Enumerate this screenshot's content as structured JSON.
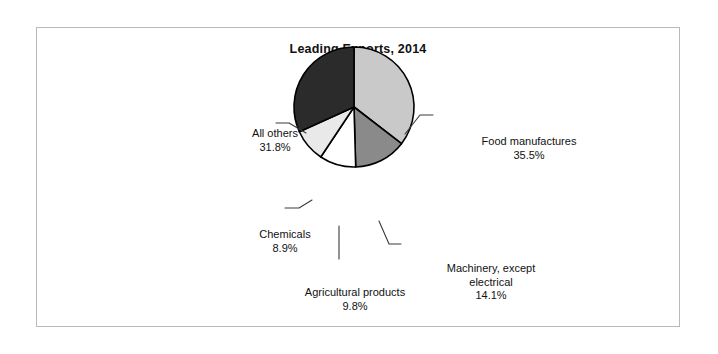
{
  "figure": {
    "title": "Leading Exports, 2014",
    "background": "#ffffff",
    "frame_color": "#b9b9b9"
  },
  "chart_data": {
    "type": "pie",
    "title": "Leading Exports, 2014",
    "xlabel": "",
    "ylabel": "",
    "legend_position": "none",
    "grid": false,
    "labels_outside": true,
    "start_angle_deg": 0,
    "direction": "clockwise",
    "categories": [
      "Food manufactures",
      "Machinery, except electrical",
      "Agricultural products",
      "Chemicals",
      "All others"
    ],
    "values": [
      35.5,
      14.1,
      9.8,
      8.9,
      31.8
    ],
    "value_suffix": "%",
    "colors": [
      "#c9c9c9",
      "#8a8a8a",
      "#ffffff",
      "#e9e9e9",
      "#2b2b2b"
    ],
    "slices": [
      {
        "name": "Food manufactures",
        "label_line1": "Food manufactures",
        "label_line2": "",
        "value": 35.5,
        "value_text": "35.5%",
        "color": "#c9c9c9"
      },
      {
        "name": "Machinery, except electrical",
        "label_line1": "Machinery, except",
        "label_line2": "electrical",
        "value": 14.1,
        "value_text": "14.1%",
        "color": "#8a8a8a"
      },
      {
        "name": "Agricultural products",
        "label_line1": "Agricultural products",
        "label_line2": "",
        "value": 9.8,
        "value_text": "9.8%",
        "color": "#ffffff"
      },
      {
        "name": "Chemicals",
        "label_line1": "Chemicals",
        "label_line2": "",
        "value": 8.9,
        "value_text": "8.9%",
        "color": "#e9e9e9"
      },
      {
        "name": "All others",
        "label_line1": "All others",
        "label_line2": "",
        "value": 31.8,
        "value_text": "31.8%",
        "color": "#2b2b2b"
      }
    ]
  }
}
